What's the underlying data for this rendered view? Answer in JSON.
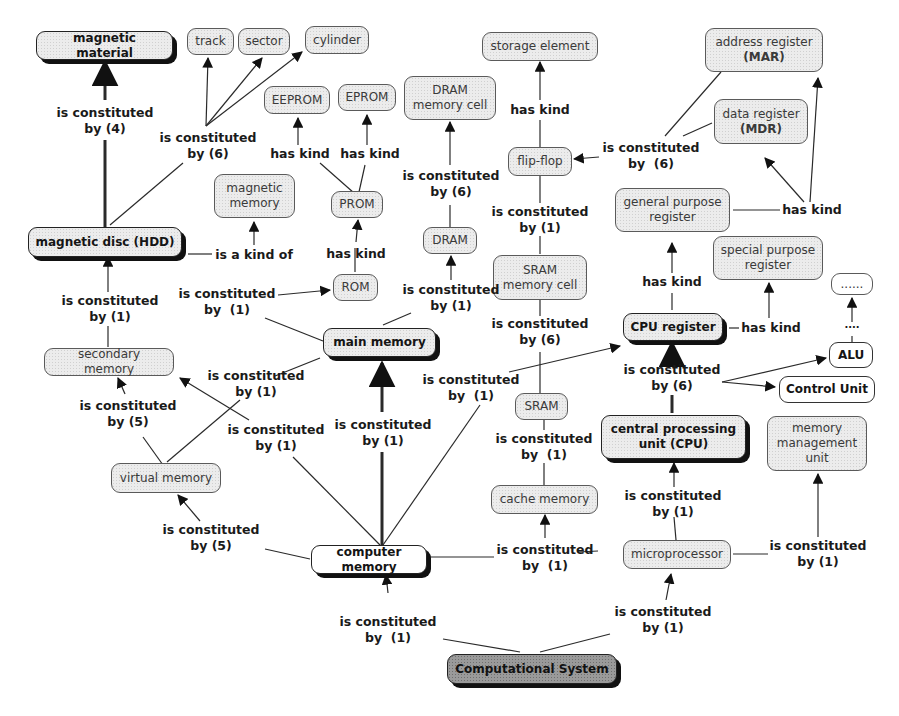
{
  "diagram": {
    "type": "concept-map",
    "colors": {
      "node_fill": "#ececec",
      "root_fill": "#9a9a9a",
      "line": "#222222",
      "text": "#1a1a1a"
    },
    "nodes": {
      "magnetic_material": "magnetic material",
      "track": "track",
      "sector": "sector",
      "cylinder": "cylinder",
      "eeprom": "EEPROM",
      "eprom": "EPROM",
      "dram_memory_cell_1": "DRAM",
      "dram_memory_cell_2": "memory cell",
      "storage_element": "storage element",
      "address_register_1": "address register",
      "address_register_2": "(MAR)",
      "data_register_1": "data register",
      "data_register_2": "(MDR)",
      "magnetic_memory_1": "magnetic",
      "magnetic_memory_2": "memory",
      "prom": "PROM",
      "flip_flop": "flip-flop",
      "general_purpose_register_1": "general purpose",
      "general_purpose_register_2": "register",
      "magnetic_disc": "magnetic disc (HDD)",
      "dram": "DRAM",
      "sram_memory_cell_1": "SRAM",
      "sram_memory_cell_2": "memory cell",
      "special_purpose_register_1": "special purpose",
      "special_purpose_register_2": "register",
      "ellipsis_node": "......",
      "rom": "ROM",
      "main_memory": "main memory",
      "cpu_register": "CPU register",
      "alu": "ALU",
      "secondary_memory": "secondary memory",
      "control_unit": "Control Unit",
      "sram": "SRAM",
      "cpu_1": "central processing",
      "cpu_2": "unit (CPU)",
      "mmu_1": "memory",
      "mmu_2": "management",
      "mmu_3": "unit",
      "virtual_memory": "virtual memory",
      "cache_memory": "cache memory",
      "computer_memory": "computer memory",
      "microprocessor": "microprocessor",
      "computational_system": "Computational System"
    },
    "links": {
      "mm_hdd": "is constituted\nby (4)",
      "hdd_tsc": "is constituted\nby (6)",
      "prom_eeprom": "has kind",
      "prom_eprom": "has kind",
      "dram_cell": "is constituted\nby (6)",
      "ff_storage": "has kind",
      "reg_ff": "is constituted\nby  (6)",
      "gpr_kinds": "has kind",
      "hdd_magmem": "is a kind of",
      "rom_prom": "has kind",
      "sramcell_ff": "is constituted\nby (1)",
      "mainmem_rom": "is constituted\nby  (1)",
      "mainmem_dram": "is constituted\nby (1)",
      "sec_hdd": "is constituted\nby (1)",
      "sram_cell": "is constituted\nby (6)",
      "cpureg_gpr": "has kind",
      "cpureg_spr": "has kind",
      "alu_dots": "....",
      "virt_main": "is constituted\nby (1)",
      "cm_cpureg": "is constituted\nby  (1)",
      "cpu_parts": "is constituted\nby (6)",
      "virt_sec": "is constituted\nby (5)",
      "cm_sec": "is constituted\nby (1)",
      "cm_main": "is constituted\nby (1)",
      "cache_sram": "is constituted\nby  (1)",
      "cm_virt": "is constituted\nby (5)",
      "micro_cpu": "is constituted\nby (1)",
      "micro_cache": "is constituted\nby  (1)",
      "micro_mmu": "is constituted\nby (1)",
      "sys_cm": "is constituted\nby  (1)",
      "sys_micro": "is constituted\nby (1)"
    }
  }
}
